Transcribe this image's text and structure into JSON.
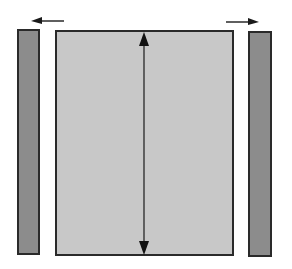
{
  "diagram": {
    "colors": {
      "background": "#ffffff",
      "center_fill": "#c8c8c8",
      "side_fill": "#8c8c8c",
      "stroke": "#2a2a2a"
    },
    "elements": {
      "left_bar": {
        "x": 17,
        "y": 29,
        "w": 23,
        "h": 226
      },
      "center_rect": {
        "x": 55,
        "y": 30,
        "w": 179,
        "h": 226
      },
      "right_bar": {
        "x": 248,
        "y": 31,
        "w": 24,
        "h": 226
      },
      "left_arrow": {
        "direction": "left"
      },
      "right_arrow": {
        "direction": "right"
      },
      "vertical_arrow": {
        "direction": "double-vertical"
      }
    }
  }
}
